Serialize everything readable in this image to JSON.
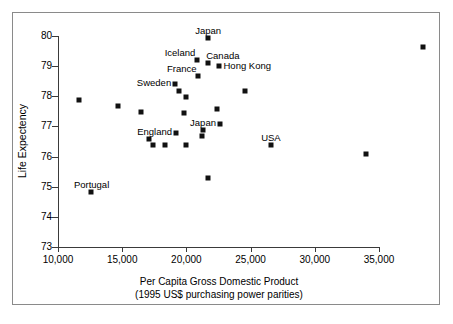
{
  "chart_data": {
    "type": "scatter",
    "title": "",
    "xlabel": "Per Capita Gross Domestic Product (1995 US$ purchasing power parities)",
    "xlabel_line1": "Per Capita Gross Domestic Product",
    "xlabel_line2": "(1995 US$ purchasing power parities)",
    "ylabel": "Life Expectency",
    "xlim": [
      10000,
      39000
    ],
    "ylim": [
      73,
      80.3
    ],
    "xticks": [
      10000,
      15000,
      20000,
      25000,
      30000,
      35000
    ],
    "xtick_labels": [
      "10,000",
      "15,000",
      "20,000",
      "25,000",
      "30,000",
      "35,000"
    ],
    "yticks": [
      73,
      74,
      75,
      76,
      77,
      78,
      79,
      80
    ],
    "ytick_labels": [
      "73",
      "74",
      "75",
      "76",
      "77",
      "78",
      "79",
      "80"
    ],
    "grid": false,
    "legend": false,
    "marker": "filled-square",
    "marker_color": "#111111",
    "points": [
      {
        "label": "Japan",
        "x": 21700,
        "y": 79.95,
        "label_pos": "above"
      },
      {
        "label": "Iceland",
        "x": 20800,
        "y": 79.2,
        "label_pos": "above-left"
      },
      {
        "label": "Canada",
        "x": 21700,
        "y": 79.1,
        "label_pos": "above-right"
      },
      {
        "label": "Hong Kong",
        "x": 22500,
        "y": 79.0,
        "label_pos": "right"
      },
      {
        "label": "France",
        "x": 20900,
        "y": 78.68,
        "label_pos": "above-left"
      },
      {
        "label": "Sweden",
        "x": 19100,
        "y": 78.4,
        "label_pos": "left"
      },
      {
        "label": "",
        "x": 19400,
        "y": 78.18
      },
      {
        "label": "",
        "x": 20000,
        "y": 77.98
      },
      {
        "label": "",
        "x": 24600,
        "y": 78.18
      },
      {
        "label": "",
        "x": 11600,
        "y": 77.88
      },
      {
        "label": "",
        "x": 14700,
        "y": 77.68
      },
      {
        "label": "",
        "x": 16500,
        "y": 77.48
      },
      {
        "label": "",
        "x": 19800,
        "y": 77.45
      },
      {
        "label": "",
        "x": 22400,
        "y": 77.58
      },
      {
        "label": "",
        "x": 22600,
        "y": 77.08
      },
      {
        "label": "England",
        "x": 19200,
        "y": 76.78,
        "label_pos": "left"
      },
      {
        "label": "Japan",
        "x": 21300,
        "y": 76.88,
        "label_pos": "above"
      },
      {
        "label": "",
        "x": 21200,
        "y": 76.68
      },
      {
        "label": "",
        "x": 17100,
        "y": 76.58
      },
      {
        "label": "",
        "x": 17400,
        "y": 76.38
      },
      {
        "label": "",
        "x": 18300,
        "y": 76.38
      },
      {
        "label": "",
        "x": 20000,
        "y": 76.38
      },
      {
        "label": "USA",
        "x": 26600,
        "y": 76.38,
        "label_pos": "above"
      },
      {
        "label": "",
        "x": 34000,
        "y": 76.08
      },
      {
        "label": "",
        "x": 21700,
        "y": 75.3
      },
      {
        "label": "Portugal",
        "x": 12600,
        "y": 74.82,
        "label_pos": "above"
      },
      {
        "label": "",
        "x": 38400,
        "y": 79.63
      }
    ]
  }
}
